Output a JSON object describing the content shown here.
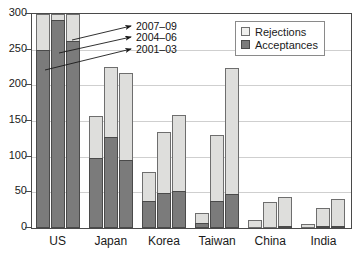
{
  "chart_data": {
    "type": "bar",
    "subtype": "stacked-grouped",
    "title": "",
    "xlabel": "",
    "ylabel": "",
    "ylim": [
      0,
      300
    ],
    "yticks": [
      0,
      50,
      100,
      150,
      200,
      250,
      300
    ],
    "grid": true,
    "legend_position": "top-right",
    "categories": [
      "US",
      "Japan",
      "Korea",
      "Taiwan",
      "China",
      "India"
    ],
    "group_labels": [
      "2001-03",
      "2004-06",
      "2007-09"
    ],
    "clipped_note": "US bars are clipped at the 300 axis maximum",
    "series": [
      {
        "name": "Acceptances",
        "color": "#7b7b7b",
        "values_by_period": {
          "2001-03": [
            250,
            98,
            38,
            7,
            0,
            0
          ],
          "2004-06": [
            292,
            127,
            49,
            38,
            0,
            2
          ],
          "2007-09": [
            262,
            95,
            52,
            48,
            3,
            1
          ]
        }
      },
      {
        "name": "Rejections",
        "color": "#dededc",
        "values_by_period": {
          "2001-03": [
            50,
            59,
            40,
            14,
            11,
            5
          ],
          "2004-06": [
            8,
            99,
            86,
            92,
            36,
            26
          ],
          "2007-09": [
            38,
            123,
            106,
            176,
            40,
            40
          ]
        }
      }
    ],
    "totals_by_period": {
      "2001-03": [
        300,
        157,
        78,
        21,
        11,
        5
      ],
      "2004-06": [
        300,
        226,
        135,
        130,
        36,
        28
      ],
      "2007-09": [
        300,
        218,
        158,
        224,
        43,
        41
      ]
    }
  },
  "legend": {
    "items": [
      {
        "label": "Rejections",
        "swatch": "rejections-swatch"
      },
      {
        "label": "Acceptances",
        "swatch": "acceptances-swatch"
      }
    ]
  },
  "annotations": [
    {
      "label": "2007–09"
    },
    {
      "label": "2004–06"
    },
    {
      "label": "2001–03"
    }
  ],
  "axis": {
    "y_labels": [
      "300",
      "250",
      "200",
      "150",
      "100",
      "50",
      "0"
    ],
    "x_labels": [
      "US",
      "Japan",
      "Korea",
      "Taiwan",
      "China",
      "India"
    ]
  }
}
